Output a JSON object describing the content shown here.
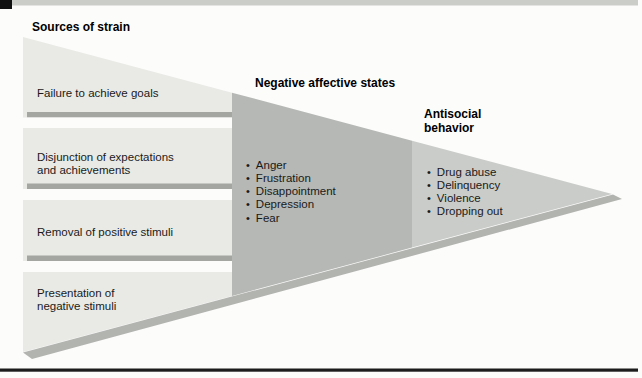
{
  "figure": {
    "headings": {
      "sources": "Sources of strain",
      "negative": "Negative affective states",
      "antisocial_lines": [
        "Antisocial",
        "behavior"
      ]
    },
    "left_boxes": [
      {
        "lines": [
          "Failure to achieve goals"
        ]
      },
      {
        "lines": [
          "Disjunction of expectations",
          "and achievements"
        ]
      },
      {
        "lines": [
          "Removal of positive stimuli"
        ]
      },
      {
        "lines": [
          "Presentation of",
          "negative stimuli"
        ]
      }
    ],
    "negative_states": [
      "Anger",
      "Frustration",
      "Disappointment",
      "Depression",
      "Fear"
    ],
    "antisocial_behaviors": [
      "Drug abuse",
      "Delinquency",
      "Violence",
      "Dropping out"
    ],
    "bullet_glyph": "•",
    "colors": {
      "background": "#fcfcfb",
      "left_band": "#e9eae6",
      "middle_band": "#b5b8b4",
      "right_band": "#c9ccc8",
      "separator_bar": "#a4a6a2",
      "shadow": "#b2b4b0",
      "top_stripe": "#cbcdc9",
      "top_block": "#111111",
      "bottom_rule": "#1c1c1c",
      "text": "#1a1a1a"
    }
  }
}
